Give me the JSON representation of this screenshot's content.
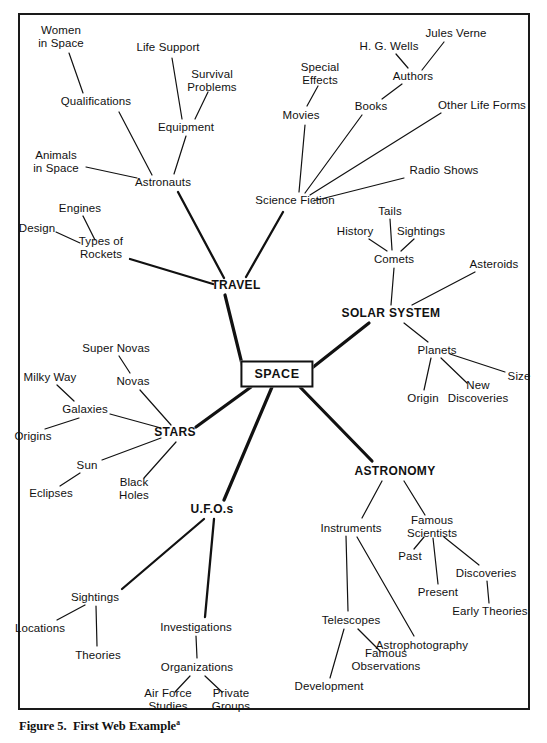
{
  "figure": {
    "caption_text": "Figure 5.  First Web Example",
    "caption_superscript": "a",
    "frame": {
      "border_color": "#1a1a1a"
    },
    "line_color": "#111111"
  },
  "diagram": {
    "type": "mind-map",
    "center": {
      "label": "SPACE",
      "x": 277,
      "y": 374,
      "style": "boxed"
    },
    "major_branches": [
      {
        "label": "TRAVEL",
        "x": 236,
        "y": 286
      },
      {
        "label": "SOLAR SYSTEM",
        "x": 391,
        "y": 314
      },
      {
        "label": "STARS",
        "x": 175,
        "y": 433
      },
      {
        "label": "ASTRONOMY",
        "x": 395,
        "y": 472
      },
      {
        "label": "U.F.O.s",
        "x": 212,
        "y": 510
      }
    ],
    "nodes": [
      {
        "label": "Women\nin Space",
        "x": 61,
        "y": 37
      },
      {
        "label": "Qualifications",
        "x": 96,
        "y": 101
      },
      {
        "label": "Life Support",
        "x": 168,
        "y": 47
      },
      {
        "label": "Survival\nProblems",
        "x": 212,
        "y": 81
      },
      {
        "label": "Equipment",
        "x": 186,
        "y": 127
      },
      {
        "label": "Animals\nin Space",
        "x": 56,
        "y": 162
      },
      {
        "label": "Astronauts",
        "x": 163,
        "y": 182
      },
      {
        "label": "Engines",
        "x": 80,
        "y": 208
      },
      {
        "label": "Design",
        "x": 37,
        "y": 228
      },
      {
        "label": "Types of\nRockets",
        "x": 101,
        "y": 248
      },
      {
        "label": "Special\nEffects",
        "x": 320,
        "y": 74
      },
      {
        "label": "Movies",
        "x": 301,
        "y": 115
      },
      {
        "label": "Books",
        "x": 371,
        "y": 106
      },
      {
        "label": "H. G. Wells",
        "x": 389,
        "y": 46
      },
      {
        "label": "Jules Verne",
        "x": 456,
        "y": 33
      },
      {
        "label": "Authors",
        "x": 413,
        "y": 76
      },
      {
        "label": "Other Life Forms",
        "x": 482,
        "y": 105
      },
      {
        "label": "Radio Shows",
        "x": 444,
        "y": 170
      },
      {
        "label": "Science Fiction",
        "x": 295,
        "y": 200
      },
      {
        "label": "Tails",
        "x": 390,
        "y": 211
      },
      {
        "label": "History",
        "x": 355,
        "y": 231
      },
      {
        "label": "Sightings",
        "x": 421,
        "y": 231
      },
      {
        "label": "Comets",
        "x": 394,
        "y": 259
      },
      {
        "label": "Asteroids",
        "x": 494,
        "y": 264
      },
      {
        "label": "Planets",
        "x": 437,
        "y": 350
      },
      {
        "label": "Origin",
        "x": 423,
        "y": 398
      },
      {
        "label": "New\nDiscoveries",
        "x": 478,
        "y": 392
      },
      {
        "label": "Size",
        "x": 519,
        "y": 376
      },
      {
        "label": "Super Novas",
        "x": 116,
        "y": 348
      },
      {
        "label": "Milky Way",
        "x": 50,
        "y": 377
      },
      {
        "label": "Novas",
        "x": 133,
        "y": 381
      },
      {
        "label": "Galaxies",
        "x": 85,
        "y": 409
      },
      {
        "label": "Origins",
        "x": 33,
        "y": 436
      },
      {
        "label": "Sun",
        "x": 87,
        "y": 465
      },
      {
        "label": "Eclipses",
        "x": 51,
        "y": 493
      },
      {
        "label": "Black\nHoles",
        "x": 134,
        "y": 489
      },
      {
        "label": "Instruments",
        "x": 351,
        "y": 528
      },
      {
        "label": "Famous\nScientists",
        "x": 432,
        "y": 527
      },
      {
        "label": "Past",
        "x": 410,
        "y": 556
      },
      {
        "label": "Present",
        "x": 438,
        "y": 592
      },
      {
        "label": "Discoveries",
        "x": 486,
        "y": 573
      },
      {
        "label": "Early Theories",
        "x": 490,
        "y": 611
      },
      {
        "label": "Telescopes",
        "x": 351,
        "y": 620
      },
      {
        "label": "Famous\nObservations",
        "x": 386,
        "y": 660
      },
      {
        "label": "Astrophotography",
        "x": 422,
        "y": 645
      },
      {
        "label": "Development",
        "x": 329,
        "y": 686
      },
      {
        "label": "Sightings",
        "x": 95,
        "y": 597
      },
      {
        "label": "Locations",
        "x": 40,
        "y": 628
      },
      {
        "label": "Theories",
        "x": 98,
        "y": 655
      },
      {
        "label": "Investigations",
        "x": 196,
        "y": 627
      },
      {
        "label": "Organizations",
        "x": 197,
        "y": 667
      },
      {
        "label": "Air Force\nStudies",
        "x": 168,
        "y": 700
      },
      {
        "label": "Private\nGroups",
        "x": 231,
        "y": 700
      }
    ],
    "edges": [
      {
        "from": "SPACE",
        "to": "TRAVEL",
        "weight": "thick"
      },
      {
        "from": "SPACE",
        "to": "SOLAR SYSTEM",
        "weight": "thick"
      },
      {
        "from": "SPACE",
        "to": "STARS",
        "weight": "thick"
      },
      {
        "from": "SPACE",
        "to": "ASTRONOMY",
        "weight": "thick"
      },
      {
        "from": "SPACE",
        "to": "U.F.O.s",
        "weight": "thick"
      },
      {
        "from": "TRAVEL",
        "to": "Astronauts",
        "weight": "medium"
      },
      {
        "from": "TRAVEL",
        "to": "Science Fiction",
        "weight": "medium"
      },
      {
        "from": "TRAVEL",
        "to": "Types of Rockets",
        "weight": "medium"
      },
      {
        "from": "Astronauts",
        "to": "Qualifications",
        "weight": "thin"
      },
      {
        "from": "Astronauts",
        "to": "Animals in Space",
        "weight": "thin"
      },
      {
        "from": "Astronauts",
        "to": "Equipment",
        "weight": "thin"
      },
      {
        "from": "Qualifications",
        "to": "Women in Space",
        "weight": "thin"
      },
      {
        "from": "Equipment",
        "to": "Life Support",
        "weight": "thin"
      },
      {
        "from": "Equipment",
        "to": "Survival Problems",
        "weight": "thin"
      },
      {
        "from": "Types of Rockets",
        "to": "Engines",
        "weight": "thin"
      },
      {
        "from": "Types of Rockets",
        "to": "Design",
        "weight": "thin"
      },
      {
        "from": "Science Fiction",
        "to": "Movies",
        "weight": "thin"
      },
      {
        "from": "Science Fiction",
        "to": "Books",
        "weight": "thin"
      },
      {
        "from": "Science Fiction",
        "to": "Other Life Forms",
        "weight": "thin"
      },
      {
        "from": "Science Fiction",
        "to": "Radio Shows",
        "weight": "thin"
      },
      {
        "from": "Movies",
        "to": "Special Effects",
        "weight": "thin"
      },
      {
        "from": "Books",
        "to": "Authors",
        "weight": "thin"
      },
      {
        "from": "Authors",
        "to": "H. G. Wells",
        "weight": "thin"
      },
      {
        "from": "Authors",
        "to": "Jules Verne",
        "weight": "thin"
      },
      {
        "from": "SOLAR SYSTEM",
        "to": "Comets",
        "weight": "thin"
      },
      {
        "from": "SOLAR SYSTEM",
        "to": "Asteroids",
        "weight": "thin"
      },
      {
        "from": "SOLAR SYSTEM",
        "to": "Planets",
        "weight": "thin"
      },
      {
        "from": "Comets",
        "to": "History",
        "weight": "thin"
      },
      {
        "from": "Comets",
        "to": "Tails",
        "weight": "thin"
      },
      {
        "from": "Comets",
        "to": "Sightings",
        "weight": "thin"
      },
      {
        "from": "Planets",
        "to": "Origin",
        "weight": "thin"
      },
      {
        "from": "Planets",
        "to": "New Discoveries",
        "weight": "thin"
      },
      {
        "from": "Planets",
        "to": "Size",
        "weight": "thin"
      },
      {
        "from": "STARS",
        "to": "Galaxies",
        "weight": "thin"
      },
      {
        "from": "STARS",
        "to": "Novas",
        "weight": "thin"
      },
      {
        "from": "STARS",
        "to": "Sun",
        "weight": "thin"
      },
      {
        "from": "STARS",
        "to": "Black Holes",
        "weight": "thin"
      },
      {
        "from": "Galaxies",
        "to": "Milky Way",
        "weight": "thin"
      },
      {
        "from": "Galaxies",
        "to": "Origins",
        "weight": "thin"
      },
      {
        "from": "Novas",
        "to": "Super Novas",
        "weight": "thin"
      },
      {
        "from": "Sun",
        "to": "Eclipses",
        "weight": "thin"
      },
      {
        "from": "ASTRONOMY",
        "to": "Instruments",
        "weight": "thin"
      },
      {
        "from": "ASTRONOMY",
        "to": "Famous Scientists",
        "weight": "thin"
      },
      {
        "from": "Famous Scientists",
        "to": "Past",
        "weight": "thin"
      },
      {
        "from": "Famous Scientists",
        "to": "Present",
        "weight": "thin"
      },
      {
        "from": "Famous Scientists",
        "to": "Discoveries",
        "weight": "thin"
      },
      {
        "from": "Discoveries",
        "to": "Early Theories",
        "weight": "thin"
      },
      {
        "from": "Instruments",
        "to": "Telescopes",
        "weight": "thin"
      },
      {
        "from": "Instruments",
        "to": "Astrophotography",
        "weight": "thin"
      },
      {
        "from": "Telescopes",
        "to": "Development",
        "weight": "thin"
      },
      {
        "from": "Telescopes",
        "to": "Famous Observations",
        "weight": "thin"
      },
      {
        "from": "U.F.O.s",
        "to": "Sightings",
        "weight": "medium"
      },
      {
        "from": "U.F.O.s",
        "to": "Investigations",
        "weight": "medium"
      },
      {
        "from": "Sightings",
        "to": "Locations",
        "weight": "thin"
      },
      {
        "from": "Sightings",
        "to": "Theories",
        "weight": "thin"
      },
      {
        "from": "Investigations",
        "to": "Organizations",
        "weight": "thin"
      },
      {
        "from": "Organizations",
        "to": "Air Force Studies",
        "weight": "thin"
      },
      {
        "from": "Organizations",
        "to": "Private Groups",
        "weight": "thin"
      }
    ],
    "line_segments": [
      {
        "x1": 243,
        "y1": 368,
        "x2": 225,
        "y2": 295,
        "w": 3.2
      },
      {
        "x1": 312,
        "y1": 368,
        "x2": 369,
        "y2": 323,
        "w": 3.2
      },
      {
        "x1": 251,
        "y1": 387,
        "x2": 196,
        "y2": 427,
        "w": 3.2
      },
      {
        "x1": 300,
        "y1": 387,
        "x2": 372,
        "y2": 461,
        "w": 3.2
      },
      {
        "x1": 272,
        "y1": 387,
        "x2": 224,
        "y2": 500,
        "w": 3.2
      },
      {
        "x1": 224,
        "y1": 278,
        "x2": 178,
        "y2": 192,
        "w": 2.3
      },
      {
        "x1": 246,
        "y1": 277,
        "x2": 283,
        "y2": 212,
        "w": 2.3
      },
      {
        "x1": 213,
        "y1": 284,
        "x2": 130,
        "y2": 259,
        "w": 2.3
      },
      {
        "x1": 152,
        "y1": 175,
        "x2": 119,
        "y2": 112,
        "w": 1.2
      },
      {
        "x1": 137,
        "y1": 178,
        "x2": 86,
        "y2": 167,
        "w": 1.2
      },
      {
        "x1": 174,
        "y1": 174,
        "x2": 186,
        "y2": 136,
        "w": 1.2
      },
      {
        "x1": 83,
        "y1": 93,
        "x2": 69,
        "y2": 53,
        "w": 1.2
      },
      {
        "x1": 182,
        "y1": 119,
        "x2": 172,
        "y2": 58,
        "w": 1.2
      },
      {
        "x1": 195,
        "y1": 119,
        "x2": 208,
        "y2": 92,
        "w": 1.2
      },
      {
        "x1": 95,
        "y1": 240,
        "x2": 83,
        "y2": 216,
        "w": 1.2
      },
      {
        "x1": 80,
        "y1": 243,
        "x2": 56,
        "y2": 232,
        "w": 1.2
      },
      {
        "x1": 299,
        "y1": 192,
        "x2": 305,
        "y2": 125,
        "w": 1.2
      },
      {
        "x1": 305,
        "y1": 193,
        "x2": 362,
        "y2": 115,
        "w": 1.2
      },
      {
        "x1": 310,
        "y1": 195,
        "x2": 441,
        "y2": 113,
        "w": 1.2
      },
      {
        "x1": 313,
        "y1": 201,
        "x2": 404,
        "y2": 178,
        "w": 1.2
      },
      {
        "x1": 307,
        "y1": 106,
        "x2": 318,
        "y2": 86,
        "w": 1.2
      },
      {
        "x1": 382,
        "y1": 99,
        "x2": 402,
        "y2": 84,
        "w": 1.2
      },
      {
        "x1": 408,
        "y1": 68,
        "x2": 396,
        "y2": 54,
        "w": 1.2
      },
      {
        "x1": 422,
        "y1": 70,
        "x2": 444,
        "y2": 42,
        "w": 1.2
      },
      {
        "x1": 391,
        "y1": 305,
        "x2": 394,
        "y2": 268,
        "w": 1.2
      },
      {
        "x1": 412,
        "y1": 305,
        "x2": 475,
        "y2": 272,
        "w": 1.2
      },
      {
        "x1": 404,
        "y1": 323,
        "x2": 428,
        "y2": 342,
        "w": 1.2
      },
      {
        "x1": 387,
        "y1": 251,
        "x2": 369,
        "y2": 239,
        "w": 1.2
      },
      {
        "x1": 392,
        "y1": 250,
        "x2": 390,
        "y2": 219,
        "w": 1.2
      },
      {
        "x1": 401,
        "y1": 251,
        "x2": 414,
        "y2": 239,
        "w": 1.2
      },
      {
        "x1": 431,
        "y1": 358,
        "x2": 424,
        "y2": 390,
        "w": 1.2
      },
      {
        "x1": 441,
        "y1": 358,
        "x2": 467,
        "y2": 383,
        "w": 1.2
      },
      {
        "x1": 450,
        "y1": 354,
        "x2": 505,
        "y2": 372,
        "w": 1.2
      },
      {
        "x1": 161,
        "y1": 428,
        "x2": 110,
        "y2": 414,
        "w": 1.2
      },
      {
        "x1": 171,
        "y1": 425,
        "x2": 140,
        "y2": 390,
        "w": 1.2
      },
      {
        "x1": 161,
        "y1": 438,
        "x2": 102,
        "y2": 460,
        "w": 1.2
      },
      {
        "x1": 176,
        "y1": 442,
        "x2": 144,
        "y2": 478,
        "w": 1.2
      },
      {
        "x1": 74,
        "y1": 401,
        "x2": 57,
        "y2": 385,
        "w": 1.2
      },
      {
        "x1": 79,
        "y1": 418,
        "x2": 45,
        "y2": 429,
        "w": 1.2
      },
      {
        "x1": 130,
        "y1": 373,
        "x2": 119,
        "y2": 356,
        "w": 1.2
      },
      {
        "x1": 80,
        "y1": 473,
        "x2": 60,
        "y2": 486,
        "w": 1.2
      },
      {
        "x1": 382,
        "y1": 481,
        "x2": 362,
        "y2": 518,
        "w": 1.2
      },
      {
        "x1": 404,
        "y1": 481,
        "x2": 425,
        "y2": 515,
        "w": 1.2
      },
      {
        "x1": 424,
        "y1": 537,
        "x2": 414,
        "y2": 549,
        "w": 1.2
      },
      {
        "x1": 433,
        "y1": 538,
        "x2": 438,
        "y2": 584,
        "w": 1.2
      },
      {
        "x1": 444,
        "y1": 537,
        "x2": 479,
        "y2": 565,
        "w": 1.2
      },
      {
        "x1": 487,
        "y1": 581,
        "x2": 489,
        "y2": 603,
        "w": 1.2
      },
      {
        "x1": 346,
        "y1": 536,
        "x2": 348,
        "y2": 611,
        "w": 1.2
      },
      {
        "x1": 357,
        "y1": 537,
        "x2": 414,
        "y2": 636,
        "w": 1.2
      },
      {
        "x1": 344,
        "y1": 629,
        "x2": 330,
        "y2": 678,
        "w": 1.2
      },
      {
        "x1": 358,
        "y1": 629,
        "x2": 380,
        "y2": 651,
        "w": 1.2
      },
      {
        "x1": 204,
        "y1": 519,
        "x2": 122,
        "y2": 589,
        "w": 2.3
      },
      {
        "x1": 214,
        "y1": 519,
        "x2": 205,
        "y2": 617,
        "w": 2.3
      },
      {
        "x1": 85,
        "y1": 605,
        "x2": 57,
        "y2": 620,
        "w": 1.2
      },
      {
        "x1": 96,
        "y1": 606,
        "x2": 97,
        "y2": 646,
        "w": 1.2
      },
      {
        "x1": 196,
        "y1": 636,
        "x2": 197,
        "y2": 658,
        "w": 1.2
      },
      {
        "x1": 190,
        "y1": 676,
        "x2": 175,
        "y2": 692,
        "w": 1.2
      },
      {
        "x1": 205,
        "y1": 676,
        "x2": 222,
        "y2": 692,
        "w": 1.2
      }
    ]
  }
}
